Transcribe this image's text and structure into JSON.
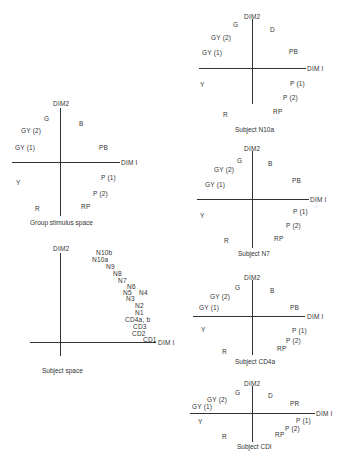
{
  "group_stimulus_space": {
    "caption": "Group stimulus space",
    "dim2": "DIM2",
    "dim1": "DIM I",
    "points": [
      {
        "label": "G",
        "x": 44,
        "y": 115
      },
      {
        "label": "B",
        "x": 79,
        "y": 120
      },
      {
        "label": "GY (2)",
        "x": 21,
        "y": 127
      },
      {
        "label": "GY (1)",
        "x": 15,
        "y": 144
      },
      {
        "label": "PB",
        "x": 99,
        "y": 144
      },
      {
        "label": "Y",
        "x": 16,
        "y": 179
      },
      {
        "label": "P (1)",
        "x": 101,
        "y": 174
      },
      {
        "label": "P (2)",
        "x": 93,
        "y": 190
      },
      {
        "label": "R",
        "x": 35,
        "y": 205
      },
      {
        "label": "RP",
        "x": 81,
        "y": 203
      }
    ]
  },
  "subject_space": {
    "caption": "Subject space",
    "dim2": "DIM2",
    "dim1": "DIM I",
    "points": [
      {
        "label": "N10b",
        "x": 96,
        "y": 249
      },
      {
        "label": "N10a",
        "x": 92,
        "y": 256
      },
      {
        "label": "N9",
        "x": 106,
        "y": 263
      },
      {
        "label": "N8",
        "x": 113,
        "y": 270
      },
      {
        "label": "N7",
        "x": 118,
        "y": 277
      },
      {
        "label": "N6",
        "x": 127,
        "y": 283
      },
      {
        "label": "N5",
        "x": 123,
        "y": 289
      },
      {
        "label": "N4",
        "x": 139,
        "y": 289
      },
      {
        "label": "N3",
        "x": 126,
        "y": 295
      },
      {
        "label": "N2",
        "x": 135,
        "y": 302
      },
      {
        "label": "N1",
        "x": 135,
        "y": 309
      },
      {
        "label": "CD4a, b",
        "x": 125,
        "y": 316
      },
      {
        "label": "CD3",
        "x": 133,
        "y": 323
      },
      {
        "label": "CD2",
        "x": 132,
        "y": 330
      },
      {
        "label": "CD1",
        "x": 143,
        "y": 336
      }
    ]
  },
  "subject_n10a": {
    "caption": "Subject N10a",
    "dim2": "DIM2",
    "dim1": "DIM I",
    "points": [
      {
        "label": "G",
        "x": 233,
        "y": 21
      },
      {
        "label": "D",
        "x": 270,
        "y": 26
      },
      {
        "label": "GY (2)",
        "x": 211,
        "y": 34
      },
      {
        "label": "GY (1)",
        "x": 202,
        "y": 49
      },
      {
        "label": "PB",
        "x": 289,
        "y": 48
      },
      {
        "label": "Y",
        "x": 200,
        "y": 81
      },
      {
        "label": "P (1)",
        "x": 290,
        "y": 80
      },
      {
        "label": "P (2)",
        "x": 283,
        "y": 94
      },
      {
        "label": "R",
        "x": 223,
        "y": 111
      },
      {
        "label": "RP",
        "x": 273,
        "y": 108
      }
    ]
  },
  "subject_n7": {
    "caption": "Subject N7",
    "dim2": "DIM2",
    "dim1": "DIM I",
    "points": [
      {
        "label": "G",
        "x": 237,
        "y": 157
      },
      {
        "label": "B",
        "x": 268,
        "y": 160
      },
      {
        "label": "GY (2)",
        "x": 214,
        "y": 166
      },
      {
        "label": "GY (1)",
        "x": 205,
        "y": 181
      },
      {
        "label": "PB",
        "x": 292,
        "y": 177
      },
      {
        "label": "Y",
        "x": 200,
        "y": 212
      },
      {
        "label": "P (1)",
        "x": 293,
        "y": 208
      },
      {
        "label": "P (2)",
        "x": 286,
        "y": 222
      },
      {
        "label": "R",
        "x": 224,
        "y": 237
      },
      {
        "label": "RP",
        "x": 274,
        "y": 235
      }
    ]
  },
  "subject_cd4a": {
    "caption": "Subject CD4a",
    "dim2": "DIM2",
    "dim1": "DIM I",
    "points": [
      {
        "label": "G",
        "x": 235,
        "y": 284
      },
      {
        "label": "B",
        "x": 270,
        "y": 287
      },
      {
        "label": "GY (2)",
        "x": 210,
        "y": 293
      },
      {
        "label": "GY (1)",
        "x": 199,
        "y": 304
      },
      {
        "label": "PB",
        "x": 290,
        "y": 304
      },
      {
        "label": "Y",
        "x": 201,
        "y": 326
      },
      {
        "label": "P (1)",
        "x": 292,
        "y": 327
      },
      {
        "label": "P (2)",
        "x": 286,
        "y": 337
      },
      {
        "label": "R",
        "x": 222,
        "y": 348
      },
      {
        "label": "RP",
        "x": 277,
        "y": 345
      }
    ]
  },
  "subject_cdi": {
    "caption": "Subject CDI",
    "dim2": "DIM2",
    "dim1": "DIM I",
    "points": [
      {
        "label": "G",
        "x": 235,
        "y": 389
      },
      {
        "label": "D",
        "x": 268,
        "y": 392
      },
      {
        "label": "GY (2)",
        "x": 207,
        "y": 396
      },
      {
        "label": "GY (1)",
        "x": 192,
        "y": 403
      },
      {
        "label": "PR",
        "x": 290,
        "y": 400
      },
      {
        "label": "Y",
        "x": 198,
        "y": 418
      },
      {
        "label": "P (1)",
        "x": 296,
        "y": 417
      },
      {
        "label": "P (2)",
        "x": 285,
        "y": 425
      },
      {
        "label": "R",
        "x": 222,
        "y": 433
      },
      {
        "label": "RP",
        "x": 275,
        "y": 431
      }
    ]
  }
}
